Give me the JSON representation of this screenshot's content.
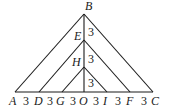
{
  "diagram": {
    "type": "nested-triangles",
    "points": {
      "A": {
        "label": "A"
      },
      "B": {
        "label": "B"
      },
      "C": {
        "label": "C"
      },
      "D": {
        "label": "D"
      },
      "E": {
        "label": "E"
      },
      "F": {
        "label": "F"
      },
      "G": {
        "label": "G"
      },
      "H": {
        "label": "H"
      },
      "I": {
        "label": "I"
      },
      "O": {
        "label": "O"
      }
    },
    "segment_lengths": {
      "AD": "3",
      "DG": "3",
      "GO": "3",
      "OI": "3",
      "IF": "3",
      "FC": "3",
      "BE": "3",
      "EH": "3",
      "HO": "3"
    },
    "triangles": [
      "ABC",
      "DEF",
      "GHI"
    ],
    "vertical_segment": "BO"
  }
}
